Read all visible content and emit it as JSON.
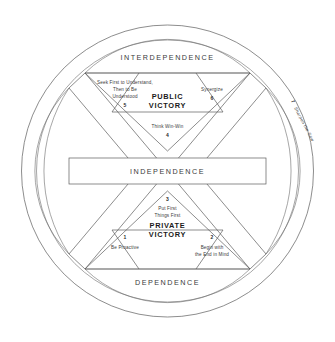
{
  "diagram": {
    "continuum": {
      "top_label": "INTERDEPENDENCE",
      "middle_label": "INDEPENDENCE",
      "bottom_label": "DEPENDENCE"
    },
    "sections": {
      "public_victory": "PUBLIC VICTORY",
      "public_victory_line1": "PUBLIC",
      "public_victory_line2": "VICTORY",
      "private_victory": "PRIVATE VICTORY",
      "private_victory_line1": "PRIVATE",
      "private_victory_line2": "VICTORY"
    },
    "habits": [
      {
        "number": "1",
        "name": "Be Proactive",
        "lines": [
          "Be Proactive"
        ],
        "group": "private_victory",
        "position": "bottom-left"
      },
      {
        "number": "2",
        "name": "Begin with the End in Mind",
        "lines": [
          "Begin with",
          "the End in Mind"
        ],
        "group": "private_victory",
        "position": "bottom-right"
      },
      {
        "number": "3",
        "name": "Put First Things First",
        "lines": [
          "Put First",
          "Things First"
        ],
        "group": "private_victory",
        "position": "bottom-center"
      },
      {
        "number": "4",
        "name": "Think Win-Win",
        "lines": [
          "Think Win-Win"
        ],
        "group": "public_victory",
        "position": "top-center"
      },
      {
        "number": "5",
        "name": "Seek First to Understand, Then to Be Understood",
        "lines": [
          "Seek First to Understand,",
          "Then to Be",
          "Understood"
        ],
        "group": "public_victory",
        "position": "top-left"
      },
      {
        "number": "6",
        "name": "Synergize",
        "lines": [
          "Synergize"
        ],
        "group": "public_victory",
        "position": "top-right"
      },
      {
        "number": "7",
        "name": "Sharpen the Saw",
        "lines": [
          "Sharpen the Saw"
        ],
        "group": "renewal",
        "position": "outer-ring-right"
      }
    ],
    "colors": {
      "stroke": "#5c5c5c",
      "text": "#2b2b2b",
      "background": "#ffffff"
    }
  }
}
